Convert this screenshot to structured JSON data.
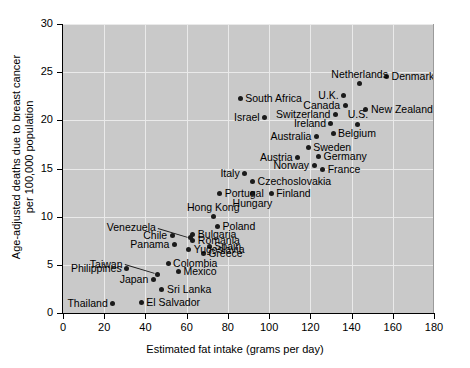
{
  "chart_data": {
    "type": "scatter",
    "title": "",
    "xlabel": "Estimated fat intake (grams per day)",
    "ylabel": "Age-adjusted deaths due to breast cancer\nper 100,000 population",
    "ylabel_line1": "Age-adjusted deaths due to breast cancer",
    "ylabel_line2": "per 100,000 population",
    "xlim": [
      0,
      180
    ],
    "ylim": [
      0,
      30
    ],
    "xticks": [
      0,
      20,
      40,
      60,
      80,
      100,
      120,
      140,
      160,
      180
    ],
    "yticks": [
      0,
      5,
      10,
      15,
      20,
      25,
      30
    ],
    "grid": true,
    "legend": null,
    "plot_background": "#c9c9c9",
    "gridline_color": "#eaeaea",
    "point_color": "#1b1b1b",
    "points": [
      {
        "label": "Thailand",
        "x": 24,
        "y": 1.0,
        "label_pos": "left"
      },
      {
        "label": "El Salvador",
        "x": 38,
        "y": 1.1,
        "label_pos": "right"
      },
      {
        "label": "Philippines",
        "x": 31,
        "y": 4.6,
        "label_pos": "left"
      },
      {
        "label": "Japan",
        "x": 44,
        "y": 3.5,
        "label_pos": "left"
      },
      {
        "label": "Taiwan",
        "x": 46,
        "y": 4.0,
        "label_pos": "leader-left"
      },
      {
        "label": "Sri Lanka",
        "x": 48,
        "y": 2.4,
        "label_pos": "right"
      },
      {
        "label": "Colombia",
        "x": 51,
        "y": 5.1,
        "label_pos": "right"
      },
      {
        "label": "Mexico",
        "x": 56,
        "y": 4.3,
        "label_pos": "right"
      },
      {
        "label": "Panama",
        "x": 54,
        "y": 7.1,
        "label_pos": "left"
      },
      {
        "label": "Chile",
        "x": 53,
        "y": 8.0,
        "label_pos": "left"
      },
      {
        "label": "Venezuela",
        "x": 62,
        "y": 7.8,
        "label_pos": "leader-left"
      },
      {
        "label": "Yugoslavia",
        "x": 61,
        "y": 6.6,
        "label_pos": "right"
      },
      {
        "label": "Romania",
        "x": 63,
        "y": 7.5,
        "label_pos": "right"
      },
      {
        "label": "Bulgaria",
        "x": 63,
        "y": 8.2,
        "label_pos": "right"
      },
      {
        "label": "Greece",
        "x": 68,
        "y": 6.2,
        "label_pos": "right"
      },
      {
        "label": "Spain",
        "x": 71,
        "y": 6.9,
        "label_pos": "right"
      },
      {
        "label": "Hong Kong",
        "x": 73,
        "y": 10.0,
        "label_pos": "above"
      },
      {
        "label": "Poland",
        "x": 75,
        "y": 9.0,
        "label_pos": "right"
      },
      {
        "label": "Portugal",
        "x": 76,
        "y": 12.4,
        "label_pos": "right"
      },
      {
        "label": "Italy",
        "x": 88,
        "y": 14.5,
        "label_pos": "left"
      },
      {
        "label": "Hungary",
        "x": 92,
        "y": 12.4,
        "label_pos": "below"
      },
      {
        "label": "Czechoslovakia",
        "x": 92,
        "y": 13.6,
        "label_pos": "right"
      },
      {
        "label": "Finland",
        "x": 101,
        "y": 12.4,
        "label_pos": "right"
      },
      {
        "label": "Israel",
        "x": 98,
        "y": 20.3,
        "label_pos": "left"
      },
      {
        "label": "South Africa",
        "x": 86,
        "y": 22.3,
        "label_pos": "right"
      },
      {
        "label": "Austria",
        "x": 114,
        "y": 16.1,
        "label_pos": "left"
      },
      {
        "label": "Norway",
        "x": 122,
        "y": 15.3,
        "label_pos": "left"
      },
      {
        "label": "France",
        "x": 126,
        "y": 14.9,
        "label_pos": "right"
      },
      {
        "label": "Germany",
        "x": 124,
        "y": 16.2,
        "label_pos": "right"
      },
      {
        "label": "Sweden",
        "x": 119,
        "y": 17.2,
        "label_pos": "right"
      },
      {
        "label": "Australia",
        "x": 123,
        "y": 18.3,
        "label_pos": "left"
      },
      {
        "label": "Belgium",
        "x": 131,
        "y": 18.6,
        "label_pos": "right"
      },
      {
        "label": "Ireland",
        "x": 130,
        "y": 19.7,
        "label_pos": "left"
      },
      {
        "label": "Switzerland",
        "x": 132,
        "y": 20.6,
        "label_pos": "left"
      },
      {
        "label": "U.S.",
        "x": 143,
        "y": 19.6,
        "label_pos": "above"
      },
      {
        "label": "Canada",
        "x": 137,
        "y": 21.5,
        "label_pos": "left"
      },
      {
        "label": "New Zealand",
        "x": 147,
        "y": 21.1,
        "label_pos": "right2"
      },
      {
        "label": "U.K.",
        "x": 136,
        "y": 22.6,
        "label_pos": "left"
      },
      {
        "label": "Netherlands",
        "x": 144,
        "y": 23.8,
        "label_pos": "above"
      },
      {
        "label": "Denmark",
        "x": 157,
        "y": 24.6,
        "label_pos": "right"
      }
    ]
  }
}
